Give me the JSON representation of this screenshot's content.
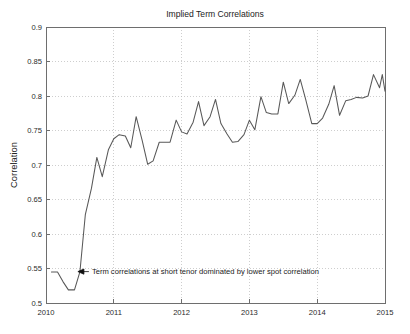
{
  "chart_data": {
    "type": "line",
    "title": "Implied Term Correlations",
    "xlabel": "",
    "ylabel": "Correlation",
    "xlim": [
      2010,
      2015
    ],
    "ylim": [
      0.5,
      0.9
    ],
    "grid": true,
    "legend": "none",
    "x_ticks": [
      "2010",
      "2011",
      "2012",
      "2013",
      "2014",
      "2015"
    ],
    "x_tick_values": [
      2010,
      2011,
      2012,
      2013,
      2014,
      2015
    ],
    "y_ticks": [
      "0.5",
      "0.55",
      "0.6",
      "0.65",
      "0.7",
      "0.75",
      "0.8",
      "0.85",
      "0.9"
    ],
    "y_tick_values": [
      0.5,
      0.55,
      0.6,
      0.65,
      0.7,
      0.75,
      0.8,
      0.85,
      0.9
    ],
    "line_color": "#585858",
    "series": [
      {
        "name": "Implied term correlation",
        "x": [
          2010.08,
          2010.17,
          2010.25,
          2010.33,
          2010.42,
          2010.5,
          2010.58,
          2010.67,
          2010.75,
          2010.83,
          2010.92,
          2011.0,
          2011.08,
          2011.17,
          2011.25,
          2011.33,
          2011.42,
          2011.5,
          2011.58,
          2011.67,
          2011.75,
          2011.83,
          2011.92,
          2012.0,
          2012.08,
          2012.17,
          2012.25,
          2012.33,
          2012.42,
          2012.5,
          2012.58,
          2012.67,
          2012.75,
          2012.83,
          2012.92,
          2013.0,
          2013.08,
          2013.17,
          2013.25,
          2013.33,
          2013.42,
          2013.5,
          2013.58,
          2013.67,
          2013.75,
          2013.83,
          2013.92,
          2014.0,
          2014.08,
          2014.17,
          2014.25,
          2014.33,
          2014.42,
          2014.5,
          2014.58,
          2014.67,
          2014.75,
          2014.83,
          2014.92
        ],
        "values": [
          0.545,
          0.545,
          0.531,
          0.519,
          0.519,
          0.545,
          0.628,
          0.666,
          0.711,
          0.683,
          0.722,
          0.738,
          0.744,
          0.742,
          0.725,
          0.77,
          0.735,
          0.701,
          0.706,
          0.733,
          0.733,
          0.733,
          0.765,
          0.748,
          0.745,
          0.762,
          0.792,
          0.757,
          0.77,
          0.795,
          0.76,
          0.745,
          0.733,
          0.734,
          0.744,
          0.765,
          0.751,
          0.799,
          0.776,
          0.774,
          0.774,
          0.82,
          0.789,
          0.801,
          0.824,
          0.795,
          0.76,
          0.76,
          0.768,
          0.788,
          0.815,
          0.772,
          0.793,
          0.795,
          0.798,
          0.797,
          0.8,
          0.831,
          0.812
        ]
      }
    ],
    "series_tail": {
      "x": [
        2014.96,
        2015.0
      ],
      "values": [
        0.831,
        0.807
      ]
    },
    "annotations": [
      {
        "text": "Term correlations at short tenor dominated by lower spot correlation",
        "x": 2010.47,
        "y": 0.5455,
        "arrow": "left-arrow"
      }
    ]
  }
}
